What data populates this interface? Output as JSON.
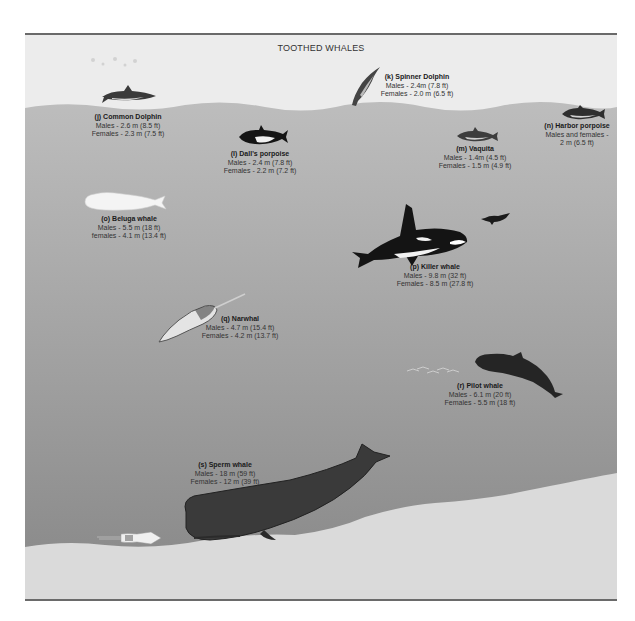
{
  "title": "TOOTHED WHALES",
  "colors": {
    "sky": "#ececec",
    "water_top": "#b8b8b8",
    "water_bottom": "#8a8a8a",
    "sea_floor": "#dcdcdc",
    "frame_border": "#6a6a6a"
  },
  "species": [
    {
      "id": "j",
      "name": "(j) Common Dolphin",
      "line1": "Males - 2.6 m (8.5 ft)",
      "line2": "Females - 2.3 m (7.5 ft)"
    },
    {
      "id": "k",
      "name": "(k) Spinner Dolphin",
      "line1": "Males - 2.4m (7.8 ft)",
      "line2": "Females - 2.0 m (6.5 ft)"
    },
    {
      "id": "l",
      "name": "(l) Dall's porpoise",
      "line1": "Males - 2.4 m (7.8 ft)",
      "line2": "Females - 2.2 m (7.2 ft)"
    },
    {
      "id": "m",
      "name": "(m) Vaquita",
      "line1": "Males - 1.4m (4.5 ft)",
      "line2": "Females - 1.5 m (4.9 ft)"
    },
    {
      "id": "n",
      "name": "(n) Harbor porpoise",
      "line1": "Males and females -",
      "line2": "2 m (6.5 ft)"
    },
    {
      "id": "o",
      "name": "(o) Beluga whale",
      "line1": "Males - 5.5 m (18 ft)",
      "line2": "females - 4.1 m (13.4 ft)"
    },
    {
      "id": "p",
      "name": "(p) Killer whale",
      "line1": "Males - 9.8 m (32 ft)",
      "line2": "Females - 8.5 m (27.8 ft)"
    },
    {
      "id": "q",
      "name": "(q) Narwhal",
      "line1": "Males - 4.7 m (15.4 ft)",
      "line2": "Females - 4.2 m (13.7 ft)"
    },
    {
      "id": "r",
      "name": "(r) Pilot whale",
      "line1": "Males - 6.1 m (20 ft)",
      "line2": "Females - 5.5 m (18 ft)"
    },
    {
      "id": "s",
      "name": "(s) Sperm whale",
      "line1": "Males - 18 m (59 ft)",
      "line2": "Females - 12 m (39 ft)"
    }
  ],
  "icons": {
    "common_dolphin": "dolphin-icon",
    "spinner_dolphin": "dolphin-icon",
    "dalls_porpoise": "porpoise-icon",
    "vaquita": "porpoise-icon",
    "harbor_porpoise": "porpoise-icon",
    "beluga": "beluga-whale-icon",
    "killer_whale": "orca-icon",
    "seal_prey": "seal-icon",
    "narwhal": "narwhal-icon",
    "pilot_whale": "pilot-whale-icon",
    "fish_school": "fish-school-icon",
    "sperm_whale": "sperm-whale-icon",
    "squid": "squid-icon"
  }
}
